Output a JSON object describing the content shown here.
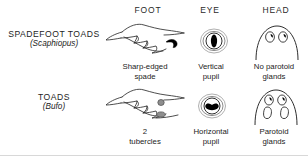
{
  "figure": {
    "type": "comparison-diagram",
    "columns": [
      {
        "id": "foot",
        "header": "FOOT"
      },
      {
        "id": "eye",
        "header": "EYE"
      },
      {
        "id": "head",
        "header": "HEAD"
      }
    ],
    "rows": [
      {
        "id": "spadefoot",
        "name": "SPADEFOOT TOADS",
        "genus": "(Scaphiopus)",
        "cells": {
          "foot": {
            "caption_line1": "Sharp-edged",
            "caption_line2": "spade",
            "icon": "spadefoot-foot-illustration"
          },
          "eye": {
            "caption_line1": "Vertical",
            "caption_line2": "pupil",
            "icon": "vertical-pupil-eye-illustration"
          },
          "head": {
            "caption_line1": "No parotoid",
            "caption_line2": "glands",
            "icon": "head-without-parotoid-glands-illustration"
          }
        }
      },
      {
        "id": "toads",
        "name": "TOADS",
        "genus": "(Bufo)",
        "cells": {
          "foot": {
            "caption_line1": "2",
            "caption_line2": "tubercles",
            "icon": "toad-foot-illustration"
          },
          "eye": {
            "caption_line1": "Horizontal",
            "caption_line2": "pupil",
            "icon": "horizontal-pupil-eye-illustration"
          },
          "head": {
            "caption_line1": "Parotoid",
            "caption_line2": "glands",
            "icon": "head-with-parotoid-glands-illustration"
          }
        }
      }
    ],
    "colors": {
      "ink": "#1a1a1a",
      "line": "#303030",
      "fill_black": "#000000",
      "fill_gray": "#8a8a8a",
      "background": "#ffffff"
    }
  }
}
